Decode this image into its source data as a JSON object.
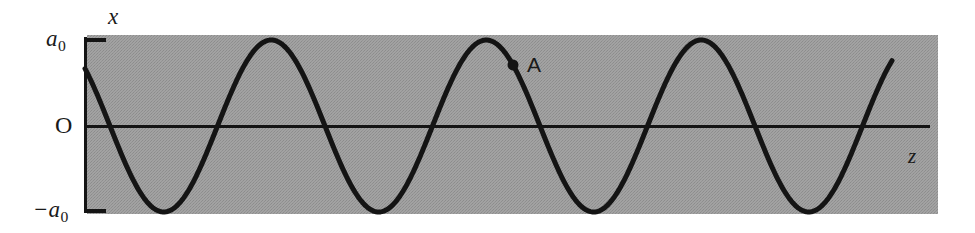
{
  "figure": {
    "title": "",
    "background_color": "#ffffff",
    "panel_color": "#9d9d9d",
    "ink_color": "#141414"
  },
  "labels": {
    "x_axis": "x",
    "z_axis": "z",
    "origin": "O",
    "amp_positive_base": "a",
    "amp_positive_sub": "0",
    "amp_negative_base": "−a",
    "amp_negative_sub": "0",
    "point_marker": "A"
  },
  "chart_data": {
    "type": "line",
    "title": "",
    "subtitle": "",
    "xlabel": "z",
    "ylabel": "x",
    "grid": false,
    "legend": null,
    "xlim": [
      0,
      851
    ],
    "ylim": [
      -1.05,
      1.05
    ],
    "yticks": [
      1,
      0,
      -1
    ],
    "ytick_labels": [
      "a₀",
      "O",
      "−a₀"
    ],
    "xticks": [],
    "xtick_labels": [],
    "series": [
      {
        "name": "wave snapshot",
        "function": "x(z) = a0 * sin(2*pi*(z0 - z)/lambda)",
        "amplitude": 1.0,
        "wavelength_px": 215,
        "phase_zero_crossing_px": 110,
        "start_value_fraction_of_a0": 0.36,
        "cycles_shown": 3.95,
        "color": "#141414",
        "linewidth_px": 5,
        "x": [
          0,
          23,
          55,
          78,
          110,
          133,
          165,
          188,
          218,
          240,
          272,
          295,
          325,
          348,
          380,
          403,
          432,
          455,
          487,
          510,
          540,
          563,
          595,
          618,
          648,
          670,
          702,
          725,
          755,
          778,
          810,
          833,
          863,
          885,
          892
        ],
        "y": [
          0.36,
          0.0,
          -0.62,
          -0.88,
          -1.0,
          -0.88,
          -0.2,
          0.28,
          0.82,
          1.0,
          0.77,
          0.42,
          0.0,
          -0.42,
          -0.93,
          -1.0,
          -0.6,
          -0.1,
          0.62,
          0.9,
          1.0,
          0.85,
          0.3,
          -0.2,
          -0.75,
          -0.95,
          -0.92,
          -0.6,
          0.0,
          0.45,
          0.92,
          1.0,
          0.55,
          0.78,
          0.85
        ]
      }
    ],
    "annotations": [
      {
        "label": "A",
        "marker": "filled-circle",
        "x_px": 513,
        "y_px": 88,
        "x_fraction_of_wavelength": 1.87,
        "y_value_fraction_of_a0": 0.45,
        "label_offset_px": [
          14,
          0
        ]
      }
    ]
  },
  "geometry": {
    "panel_left_px": 87,
    "panel_right_px": 938,
    "panel_top_px": 35,
    "panel_bottom_px": 214,
    "axis_x_px": 85,
    "axis_y_px": 126,
    "tick_top_y_px": 40,
    "tick_bottom_y_px": 211,
    "tick_length_px": 20,
    "z_axis_end_px": 930
  }
}
